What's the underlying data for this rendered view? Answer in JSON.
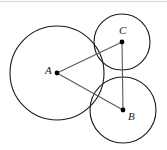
{
  "figure": {
    "type": "geometry-diagram",
    "width": 167,
    "height": 150,
    "background_color": "#ffffff",
    "stroke_color": "#1a1a1a",
    "segment_color": "#555555",
    "point_color": "#000000",
    "circles": [
      {
        "id": "circle-A",
        "center_label": "A",
        "cx": 57,
        "cy": 73,
        "r": 47
      },
      {
        "id": "circle-C",
        "center_label": "C",
        "cx": 122,
        "cy": 42,
        "r": 28
      },
      {
        "id": "circle-B",
        "center_label": "B",
        "cx": 123,
        "cy": 110,
        "r": 33
      }
    ],
    "points": [
      {
        "id": "point-A",
        "label": "A",
        "x": 57,
        "y": 73
      },
      {
        "id": "point-C",
        "label": "C",
        "x": 122,
        "y": 42
      },
      {
        "id": "point-B",
        "label": "B",
        "x": 123,
        "y": 110
      }
    ],
    "segments": [
      {
        "id": "segment-AC",
        "from": "A",
        "to": "C",
        "x1": 57,
        "y1": 73,
        "x2": 122,
        "y2": 42
      },
      {
        "id": "segment-AB",
        "from": "A",
        "to": "B",
        "x1": 57,
        "y1": 73,
        "x2": 123,
        "y2": 110
      },
      {
        "id": "segment-CB",
        "from": "C",
        "to": "B",
        "x1": 122,
        "y1": 42,
        "x2": 123,
        "y2": 110
      }
    ],
    "labels": {
      "A": "A",
      "B": "B",
      "C": "C"
    },
    "top_rule": {
      "color": "#cfcfcf",
      "y": 1
    }
  }
}
